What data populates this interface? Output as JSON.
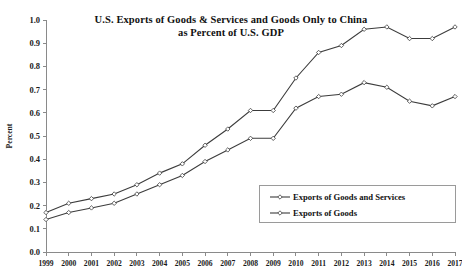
{
  "chart_data": {
    "type": "line",
    "title": "U.S. Exports of Goods & Services and Goods Only to China as Percent of U.S. GDP",
    "title_lines": [
      "U.S. Exports of Goods & Services and Goods Only to China",
      "as Percent of U.S. GDP"
    ],
    "xlabel": "",
    "ylabel": "Percent",
    "x": [
      1999,
      2000,
      2001,
      2002,
      2003,
      2004,
      2005,
      2006,
      2007,
      2008,
      2009,
      2010,
      2011,
      2012,
      2013,
      2014,
      2015,
      2016,
      2017
    ],
    "categories": [
      "1999",
      "2000",
      "2001",
      "2002",
      "2003",
      "2004",
      "2005",
      "2006",
      "2007",
      "2008",
      "2009",
      "2010",
      "2011",
      "2012",
      "2013",
      "2014",
      "2015",
      "2016",
      "2017"
    ],
    "series": [
      {
        "name": "Exports of Goods and Services",
        "values": [
          0.17,
          0.21,
          0.23,
          0.25,
          0.29,
          0.34,
          0.38,
          0.46,
          0.53,
          0.61,
          0.61,
          0.75,
          0.86,
          0.89,
          0.96,
          0.97,
          0.92,
          0.92,
          0.97
        ]
      },
      {
        "name": "Exports of Goods",
        "values": [
          0.14,
          0.17,
          0.19,
          0.21,
          0.25,
          0.29,
          0.33,
          0.39,
          0.44,
          0.49,
          0.49,
          0.62,
          0.67,
          0.68,
          0.73,
          0.71,
          0.65,
          0.63,
          0.67
        ]
      }
    ],
    "ylim": [
      0.0,
      1.0
    ],
    "ytick_labels": [
      "0.0",
      "0.1",
      "0.2",
      "0.3",
      "0.4",
      "0.5",
      "0.6",
      "0.7",
      "0.8",
      "0.9",
      "1.0"
    ],
    "ytick_values": [
      0.0,
      0.1,
      0.2,
      0.3,
      0.4,
      0.5,
      0.6,
      0.7,
      0.8,
      0.9,
      1.0
    ],
    "grid": false,
    "legend_position": "inside-lower-right",
    "legend_entries": [
      "Exports of Goods and Services",
      "Exports of Goods"
    ],
    "marker": "open-diamond",
    "line_color": "#3c3c3c",
    "marker_fill": "#ffffff",
    "background": "#ffffff"
  }
}
